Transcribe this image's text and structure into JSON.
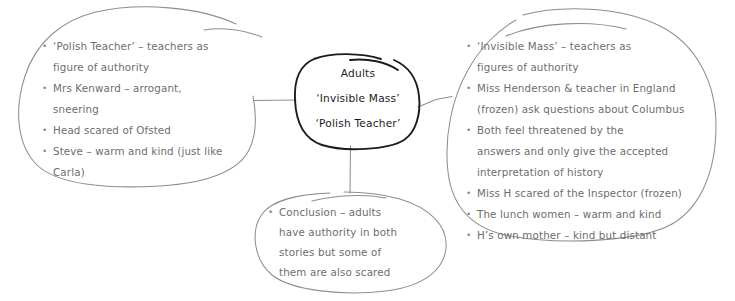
{
  "diagram": {
    "type": "mind-map",
    "title_node": {
      "lines": [
        "Adults",
        "‘Invisible Mass’",
        "‘Polish Teacher’"
      ]
    },
    "branches": {
      "left": {
        "label": "polish-teacher-branch",
        "bullets": [
          {
            "main": "‘Polish Teacher’ – teachers as",
            "cont": [
              "figure of authority"
            ]
          },
          {
            "main": "Mrs Kenward – arrogant,",
            "cont": [
              "sneering"
            ]
          },
          {
            "main": "Head scared of Ofsted",
            "cont": []
          },
          {
            "main": "Steve – warm and kind (just like",
            "cont": [
              "Carla)"
            ]
          }
        ]
      },
      "right": {
        "label": "invisible-mass-branch",
        "bullets": [
          {
            "main": "‘Invisible Mass’ – teachers as",
            "cont": [
              "figures of authority"
            ]
          },
          {
            "main": "Miss Henderson & teacher in England",
            "cont": [
              "(frozen) ask questions about Columbus"
            ]
          },
          {
            "main": "Both feel threatened by the",
            "cont": [
              "answers and only give the accepted",
              "interpretation of history"
            ]
          },
          {
            "main": "Miss H scared of the Inspector (frozen)",
            "cont": []
          },
          {
            "main": "The lunch women – warm and kind",
            "cont": []
          },
          {
            "main": "H’s own mother – kind but distant",
            "cont": []
          }
        ]
      },
      "bottom": {
        "label": "conclusion-branch",
        "bullets": [
          {
            "main": "Conclusion – adults",
            "cont": [
              "have authority in both",
              "stories but some of",
              "them are also scared"
            ]
          }
        ]
      }
    },
    "colors": {
      "body_text": "#6d6d6d",
      "center_text": "#1c1c1c",
      "bubble_stroke": "#8e8e8e",
      "center_stroke": "#1c1c1c",
      "connector_stroke": "#8e8e8e",
      "background": "#ffffff"
    }
  }
}
